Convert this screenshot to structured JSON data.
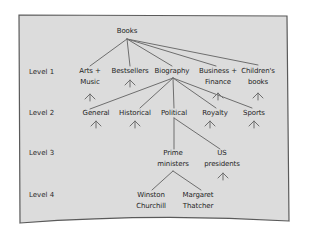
{
  "diagram": {
    "type": "tree",
    "root": {
      "label": "Books",
      "x": 127,
      "y": 33
    },
    "level_labels": [
      {
        "label": "Level 1",
        "y": 72
      },
      {
        "label": "Level 2",
        "y": 113
      },
      {
        "label": "Level 3",
        "y": 153
      },
      {
        "label": "Level 4",
        "y": 195
      }
    ],
    "level1": [
      {
        "line1": "Arts +",
        "line2": "Music",
        "x": 90
      },
      {
        "line1": "Bestsellers",
        "line2": "",
        "x": 130
      },
      {
        "line1": "Biography",
        "line2": "",
        "x": 172
      },
      {
        "line1": "Business +",
        "line2": "Finance",
        "x": 218
      },
      {
        "line1": "Children's",
        "line2": "books",
        "x": 258
      }
    ],
    "level2": [
      {
        "line1": "General",
        "x": 96
      },
      {
        "line1": "Historical",
        "x": 135
      },
      {
        "line1": "Political",
        "x": 174
      },
      {
        "line1": "Royalty",
        "x": 215
      },
      {
        "line1": "Sports",
        "x": 254
      }
    ],
    "level3": [
      {
        "line1": "Prime",
        "line2": "ministers",
        "x": 173
      },
      {
        "line1": "US",
        "line2": "presidents",
        "x": 222
      }
    ],
    "level4": [
      {
        "line1": "Winston",
        "line2": "Churchill",
        "x": 151
      },
      {
        "line1": "Margaret",
        "line2": "Thatcher",
        "x": 198
      }
    ],
    "colors": {
      "panel": "#dcdcdc",
      "border": "#555555",
      "line": "#6a6a6a",
      "text": "#1e1e1e"
    }
  }
}
